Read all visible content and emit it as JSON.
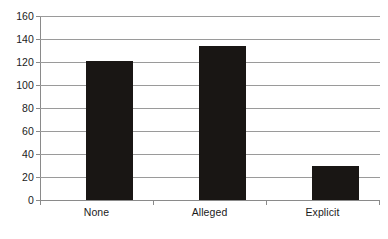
{
  "chart_data": {
    "type": "bar",
    "title": "",
    "subtitle": "",
    "xlabel": "",
    "ylabel": "",
    "categories": [
      "None",
      "Alleged",
      "Explicit"
    ],
    "values": [
      121,
      134,
      30
    ],
    "series": [
      {
        "name": "",
        "values": [
          121,
          134,
          30
        ]
      }
    ],
    "ylim": [
      0,
      160
    ],
    "ytick_step": 20,
    "yticks": [
      0,
      20,
      40,
      60,
      80,
      100,
      120,
      140,
      160
    ],
    "ytick_labels": [
      "0",
      "20",
      "40",
      "60",
      "80",
      "100",
      "120",
      "140",
      "160"
    ],
    "grid": true,
    "grid_axis": "y",
    "legend": false,
    "legend_position": "none",
    "annotations": [],
    "bar_color": "#191614",
    "grid_color": "#9a9a9a",
    "axis_color": "#8a8a8a",
    "background_color": "#ffffff",
    "text_color": "#1b1b1b"
  }
}
